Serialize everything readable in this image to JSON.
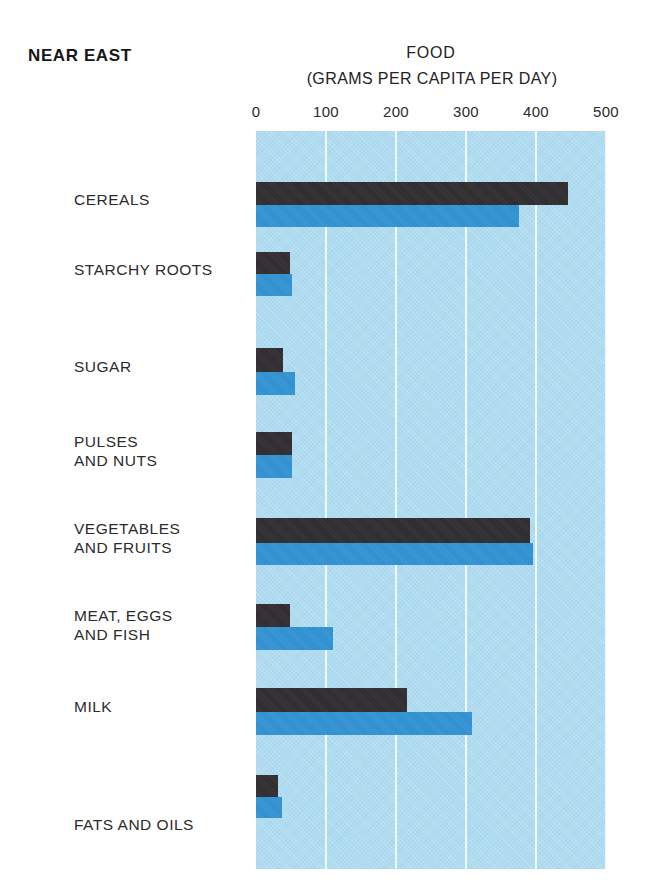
{
  "header": {
    "region": "NEAR EAST",
    "title": "FOOD",
    "subtitle": "(GRAMS PER CAPITA PER DAY)"
  },
  "colors": {
    "plot_background": "#aedbf0",
    "gridline": "#f3fbff",
    "series_dark": "#2e2b2e",
    "series_blue": "#2d8fcf",
    "page_background": "#ffffff"
  },
  "chart_data": {
    "type": "bar",
    "orientation": "horizontal",
    "title": "FOOD",
    "subtitle": "(GRAMS PER CAPITA PER DAY)",
    "region": "NEAR EAST",
    "xlabel": "(GRAMS PER CAPITA PER DAY)",
    "ylabel": "",
    "xlim": [
      0,
      500
    ],
    "xticks": [
      0,
      100,
      200,
      300,
      400,
      500
    ],
    "xtick_labels": [
      "0",
      "100",
      "200",
      "300",
      "400",
      "500"
    ],
    "grid": true,
    "grid_axis": "x",
    "legend": null,
    "legend_position": "none",
    "categories": [
      "CEREALS",
      "STARCHY ROOTS",
      "SUGAR",
      "PULSES\nAND NUTS",
      "VEGETABLES\nAND FRUITS",
      "MEAT, EGGS\nAND FISH",
      "MILK",
      "FATS AND OILS"
    ],
    "series": [
      {
        "name": "dark",
        "color": "#2e2b2e",
        "values": [
          445,
          48,
          38,
          51,
          392,
          48,
          216,
          31
        ]
      },
      {
        "name": "blue",
        "color": "#2d8fcf",
        "values": [
          375,
          51,
          55,
          52,
          396,
          110,
          309,
          37
        ]
      }
    ]
  },
  "layout": {
    "plot_left_px": 256,
    "plot_top_px": 131,
    "plot_width_px": 350,
    "plot_height_px": 738,
    "px_per_unit": 0.7,
    "rows": [
      {
        "category": "CEREALS",
        "label_top": 190,
        "dark_top": 182,
        "dark_height": 23,
        "blue_top": 205,
        "blue_height": 22
      },
      {
        "category": "STARCHY ROOTS",
        "label_top": 260,
        "dark_top": 252,
        "dark_height": 22,
        "blue_top": 274,
        "blue_height": 22
      },
      {
        "category": "SUGAR",
        "label_top": 357,
        "dark_top": 348,
        "dark_height": 24,
        "blue_top": 372,
        "blue_height": 23
      },
      {
        "category": "PULSES AND NUTS",
        "label_top": 432,
        "dark_top": 432,
        "dark_height": 23,
        "blue_top": 455,
        "blue_height": 23
      },
      {
        "category": "VEGETABLES AND FRUITS",
        "label_top": 519,
        "dark_top": 518,
        "dark_height": 25,
        "blue_top": 543,
        "blue_height": 22
      },
      {
        "category": "MEAT, EGGS AND FISH",
        "label_top": 606,
        "dark_top": 604,
        "dark_height": 23,
        "blue_top": 627,
        "blue_height": 23
      },
      {
        "category": "MILK",
        "label_top": 697,
        "dark_top": 688,
        "dark_height": 24,
        "blue_top": 712,
        "blue_height": 23
      },
      {
        "category": "FATS AND OILS",
        "label_top": 815,
        "dark_top": 775,
        "dark_height": 22,
        "blue_top": 797,
        "blue_height": 21
      }
    ]
  }
}
